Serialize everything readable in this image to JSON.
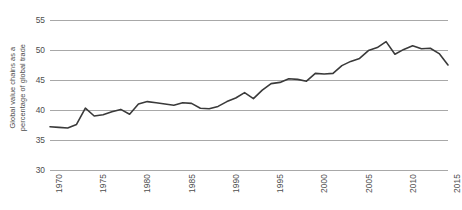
{
  "chart_data": {
    "type": "line",
    "title": "",
    "xlabel": "",
    "ylabel": "Global value chains as a percentage of global trade",
    "ylabel_lines": [
      "Global value chains as a",
      "percentage of global trade"
    ],
    "ylim": [
      30,
      55
    ],
    "xlim": [
      1970,
      2015
    ],
    "yticks": [
      30,
      35,
      40,
      45,
      50,
      55
    ],
    "ytick_labels": [
      "30",
      "35",
      "40",
      "45",
      "50",
      "55"
    ],
    "xticks": [
      1970,
      1975,
      1980,
      1985,
      1990,
      1995,
      2000,
      2005,
      2010,
      2015
    ],
    "xtick_labels": [
      "1970",
      "1975",
      "1980",
      "1985",
      "1990",
      "1995",
      "2000",
      "2005",
      "2010",
      "2015"
    ],
    "grid": true,
    "legend": false,
    "legend_position": "none",
    "line_color": "#3a3a3a",
    "grid_color": "#a8a8a8",
    "background_color": "#ffffff",
    "x": [
      1970,
      1971,
      1972,
      1973,
      1974,
      1975,
      1976,
      1977,
      1978,
      1979,
      1980,
      1981,
      1982,
      1983,
      1984,
      1985,
      1986,
      1987,
      1988,
      1989,
      1990,
      1991,
      1992,
      1993,
      1994,
      1995,
      1996,
      1997,
      1998,
      1999,
      2000,
      2001,
      2002,
      2003,
      2004,
      2005,
      2006,
      2007,
      2008,
      2009,
      2010,
      2011,
      2012,
      2013,
      2014,
      2015
    ],
    "values": [
      37.2,
      37.1,
      37.0,
      37.6,
      40.3,
      39.0,
      39.2,
      39.7,
      40.1,
      39.3,
      41.0,
      41.4,
      41.2,
      41.0,
      40.8,
      41.2,
      41.1,
      40.3,
      40.2,
      40.6,
      41.4,
      42.0,
      42.9,
      41.9,
      43.3,
      44.4,
      44.6,
      45.2,
      45.1,
      44.8,
      46.1,
      46.0,
      46.1,
      47.4,
      48.1,
      48.6,
      49.9,
      50.4,
      51.4,
      49.3,
      50.1,
      50.7,
      50.2,
      50.3,
      49.4,
      47.5
    ],
    "series": [
      {
        "name": "Global value chains as a percentage of global trade",
        "values": [
          37.2,
          37.1,
          37.0,
          37.6,
          40.3,
          39.0,
          39.2,
          39.7,
          40.1,
          39.3,
          41.0,
          41.4,
          41.2,
          41.0,
          40.8,
          41.2,
          41.1,
          40.3,
          40.2,
          40.6,
          41.4,
          42.0,
          42.9,
          41.9,
          43.3,
          44.4,
          44.6,
          45.2,
          45.1,
          44.8,
          46.1,
          46.0,
          46.1,
          47.4,
          48.1,
          48.6,
          49.9,
          50.4,
          51.4,
          49.3,
          50.1,
          50.7,
          50.2,
          50.3,
          49.4,
          47.5
        ]
      }
    ]
  }
}
